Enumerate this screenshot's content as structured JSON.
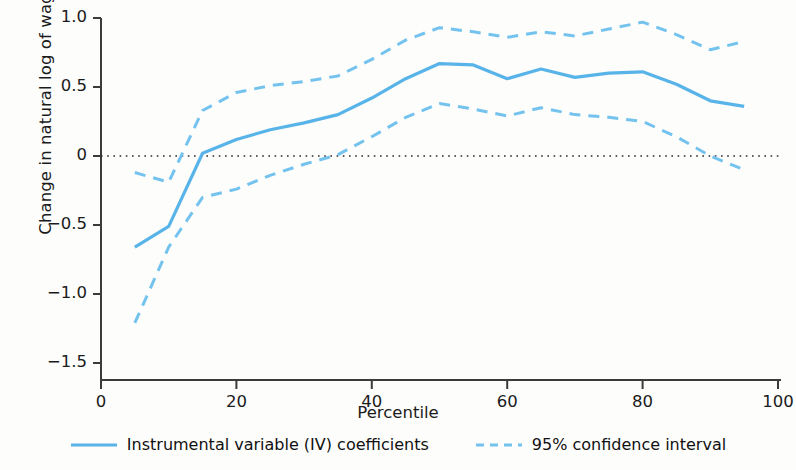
{
  "chart_data": {
    "type": "line",
    "title": "",
    "xlabel": "Percentile",
    "ylabel": "Change in natural log of wages",
    "xlim": [
      0,
      100
    ],
    "ylim": [
      -1.5,
      1.0
    ],
    "xticks": [
      "0",
      "20",
      "40",
      "60",
      "80",
      "100"
    ],
    "xtick_values": [
      0,
      20,
      40,
      60,
      80,
      100
    ],
    "yticks": [
      "1.0",
      "0.5",
      "0",
      "-0.5",
      "-1.0",
      "-1.5"
    ],
    "ytick_values": [
      1.0,
      0.5,
      0,
      -0.5,
      -1.0,
      -1.5
    ],
    "grid": false,
    "zero_reference_line": 0,
    "legend_position": "bottom",
    "x": [
      5,
      10,
      15,
      20,
      25,
      30,
      35,
      40,
      45,
      50,
      55,
      60,
      65,
      70,
      75,
      80,
      85,
      90,
      95
    ],
    "series": [
      {
        "name": "Instrumental variable (IV) coefficients",
        "style": "solid",
        "color": "#58b4e8",
        "values": [
          -0.66,
          -0.51,
          0.02,
          0.12,
          0.19,
          0.24,
          0.3,
          0.42,
          0.56,
          0.67,
          0.66,
          0.56,
          0.63,
          0.57,
          0.6,
          0.61,
          0.52,
          0.4,
          0.36
        ]
      },
      {
        "name": "95% confidence interval upper",
        "style": "dashed",
        "color": "#74c3ee",
        "values": [
          -0.12,
          -0.19,
          0.33,
          0.46,
          0.51,
          0.54,
          0.58,
          0.7,
          0.84,
          0.93,
          0.9,
          0.86,
          0.9,
          0.87,
          0.92,
          0.97,
          0.88,
          0.77,
          0.83
        ]
      },
      {
        "name": "95% confidence interval lower",
        "style": "dashed",
        "color": "#74c3ee",
        "values": [
          -1.21,
          -0.66,
          -0.3,
          -0.24,
          -0.14,
          -0.06,
          0.01,
          0.14,
          0.28,
          0.38,
          0.34,
          0.29,
          0.35,
          0.3,
          0.28,
          0.25,
          0.14,
          0.0,
          -0.1
        ]
      }
    ],
    "legend": [
      {
        "label": "Instrumental variable (IV) coefficients",
        "style": "solid",
        "color": "#58b4e8"
      },
      {
        "label": "95% confidence interval",
        "style": "dashed",
        "color": "#74c3ee"
      }
    ]
  }
}
